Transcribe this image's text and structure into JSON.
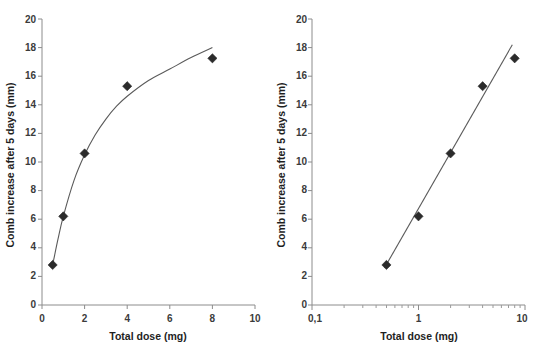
{
  "figure": {
    "panels": [
      {
        "name": "linear-dose-response",
        "xlabel": "Total dose (mg)",
        "ylabel": "Comb increase after 5 days (mm)",
        "x_ticks": [
          "0",
          "2",
          "4",
          "6",
          "8",
          "10"
        ],
        "y_ticks": [
          "0",
          "2",
          "4",
          "6",
          "8",
          "10",
          "12",
          "14",
          "16",
          "18",
          "20"
        ]
      },
      {
        "name": "log-dose-response",
        "xlabel": "Total dose (mg)",
        "ylabel": "Comb increase after 5 days (mm)",
        "x_ticks": [
          "0,1",
          "1",
          "10"
        ],
        "y_ticks": [
          "0",
          "2",
          "4",
          "6",
          "8",
          "10",
          "12",
          "14",
          "16",
          "18",
          "20"
        ]
      }
    ],
    "colors": {
      "marker": "#2b2b2b",
      "curve": "#5a5a5a",
      "axis": "#8c8c8c",
      "text": "#1f1f1f",
      "background": "#ffffff"
    }
  },
  "chart_data": [
    {
      "type": "scatter",
      "title": "",
      "panel": "left",
      "xlabel": "Total dose (mg)",
      "ylabel": "Comb increase after 5 days (mm)",
      "xscale": "linear",
      "yscale": "linear",
      "xlim": [
        0,
        10
      ],
      "ylim": [
        0,
        20
      ],
      "xticks": [
        0,
        2,
        4,
        6,
        8,
        10
      ],
      "yticks": [
        0,
        2,
        4,
        6,
        8,
        10,
        12,
        14,
        16,
        18,
        20
      ],
      "xtick_labels": [
        "0",
        "2",
        "4",
        "6",
        "8",
        "10"
      ],
      "ytick_labels": [
        "0",
        "2",
        "4",
        "6",
        "8",
        "10",
        "12",
        "14",
        "16",
        "18",
        "20"
      ],
      "grid": false,
      "legend": "none",
      "series": [
        {
          "name": "Observed comb increase",
          "marker": "diamond",
          "x": [
            0.5,
            1.0,
            2.0,
            4.0,
            8.0
          ],
          "y": [
            2.8,
            6.2,
            10.6,
            15.3,
            17.25
          ]
        },
        {
          "name": "Fitted saturating curve",
          "style": "line",
          "x": [
            0.5,
            0.75,
            1.0,
            1.5,
            2.0,
            2.5,
            3.0,
            3.5,
            4.0,
            5.0,
            6.0,
            7.0,
            8.0
          ],
          "y": [
            2.8,
            4.6,
            6.2,
            8.7,
            10.5,
            11.9,
            13.0,
            13.9,
            14.6,
            15.7,
            16.5,
            17.3,
            18.0
          ]
        }
      ]
    },
    {
      "type": "scatter",
      "title": "",
      "panel": "right",
      "xlabel": "Total dose (mg)",
      "ylabel": "Comb increase after 5 days (mm)",
      "xscale": "log",
      "yscale": "linear",
      "xlim": [
        0.1,
        10
      ],
      "ylim": [
        0,
        20
      ],
      "xticks": [
        0.1,
        1,
        10
      ],
      "yticks": [
        0,
        2,
        4,
        6,
        8,
        10,
        12,
        14,
        16,
        18,
        20
      ],
      "xtick_labels": [
        "0,1",
        "1",
        "10"
      ],
      "ytick_labels": [
        "0",
        "2",
        "4",
        "6",
        "8",
        "10",
        "12",
        "14",
        "16",
        "18",
        "20"
      ],
      "grid": false,
      "legend": "none",
      "series": [
        {
          "name": "Observed comb increase",
          "marker": "diamond",
          "x": [
            0.5,
            1.0,
            2.0,
            4.0,
            8.0
          ],
          "y": [
            2.8,
            6.2,
            10.6,
            15.3,
            17.25
          ]
        },
        {
          "name": "Fitted log-linear regression",
          "style": "line",
          "x": [
            0.48,
            7.6
          ],
          "y": [
            2.6,
            18.2
          ]
        }
      ]
    }
  ]
}
